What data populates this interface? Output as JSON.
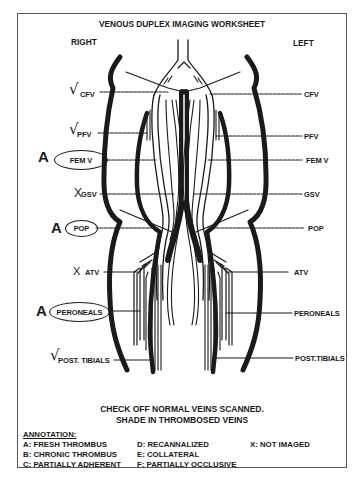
{
  "title": "VENOUS DUPLEX IMAGING WORKSHEET",
  "sides": {
    "right": "RIGHT",
    "left": "LEFT"
  },
  "right_veins": [
    {
      "label": "CFV",
      "mark": "√",
      "circled": false
    },
    {
      "label": "PFV",
      "mark": "√",
      "circled": false
    },
    {
      "label": "FEM V",
      "mark": "A",
      "circled": true
    },
    {
      "label": "GSV",
      "mark": "X",
      "circled": false
    },
    {
      "label": "POP",
      "mark": "A",
      "circled": true
    },
    {
      "label": "ATV",
      "mark": "X",
      "circled": false
    },
    {
      "label": "PERONEALS",
      "mark": "A",
      "circled": true
    },
    {
      "label": "POST. TIBIALS",
      "mark": "√",
      "circled": false
    }
  ],
  "left_veins": [
    {
      "label": "CFV"
    },
    {
      "label": "PFV"
    },
    {
      "label": "FEM V"
    },
    {
      "label": "GSV"
    },
    {
      "label": "POP"
    },
    {
      "label": "ATV"
    },
    {
      "label": "PERONEALS"
    },
    {
      "label": "POST.TIBIALS"
    }
  ],
  "instructions": {
    "line1": "CHECK OFF NORMAL VEINS SCANNED.",
    "line2": "SHADE IN THROMBOSED VEINS"
  },
  "annotation": {
    "heading": "ANNOTATION:",
    "items": [
      "A: FRESH THROMBUS",
      "B: CHRONIC THROMBUS",
      "C: PARTIALLY ADHERENT",
      "D: RECANNALIZED",
      "E: COLLATERAL",
      "F: PARTIALLY OCCLUSIVE",
      "X: NOT IMAGED"
    ]
  }
}
